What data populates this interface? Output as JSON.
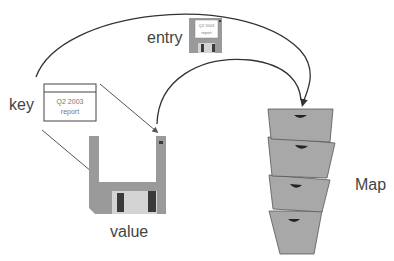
{
  "diagram": {
    "labels": {
      "key": "key",
      "entry": "entry",
      "value": "value",
      "map": "Map"
    },
    "key_card": {
      "line1": "Q2 2003",
      "line2": "report"
    },
    "entry_disk_card": {
      "line1": "Q2 2003",
      "line2": "report"
    },
    "colors": {
      "disk_gray": "#9a9a9a",
      "disk_label": "#ffffff",
      "shutter": "#d4d4d4",
      "shutter_slot": "#3a3a3a",
      "drawer_fill": "#a8a8a8",
      "drawer_stroke": "#555555",
      "arrow": "#333333",
      "text": "#444444"
    },
    "map_drawers": 4
  }
}
